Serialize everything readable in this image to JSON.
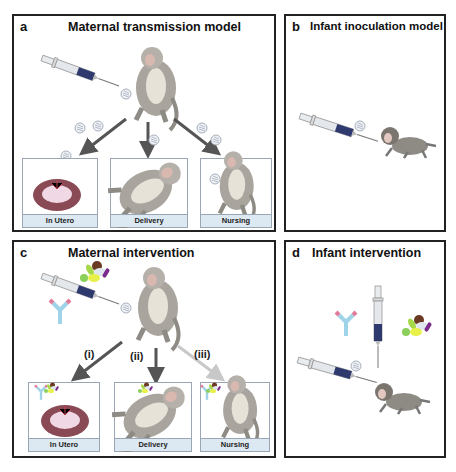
{
  "panels": {
    "a": {
      "letter": "a",
      "title": "Maternal transmission model",
      "boxes": [
        "In Utero",
        "Delivery",
        "Nursing"
      ]
    },
    "b": {
      "letter": "b",
      "title": "Infant inoculation model"
    },
    "c": {
      "letter": "c",
      "title": "Maternal intervention",
      "boxes": [
        "In Utero",
        "Delivery",
        "Nursing"
      ],
      "routes": [
        "(i)",
        "(ii)",
        "(iii)"
      ]
    },
    "d": {
      "letter": "d",
      "title": "Infant intervention"
    }
  },
  "colors": {
    "border": "#222222",
    "caption_bg": "#dce8f2",
    "arrow_dark": "#555555",
    "arrow_light": "#c8c8c8",
    "syringe_fluid": "#2e3a6e",
    "antibody_blue": "#9fd3e8",
    "antibody_pink": "#e07a9a",
    "placenta": "#8a4a55",
    "monkey": "#8e8a84"
  },
  "icons": [
    "syringe-icon",
    "virus-particle-icon",
    "monkey-adult-icon",
    "monkey-infant-icon",
    "antibody-icon",
    "drug-pills-icon",
    "placenta-icon"
  ]
}
